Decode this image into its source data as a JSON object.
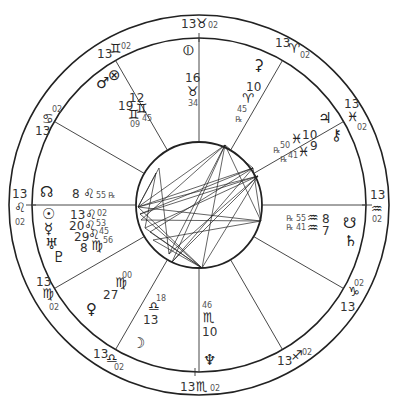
{
  "chart": {
    "center": [
      199,
      205
    ],
    "radii": {
      "outer": 190,
      "middle": 167,
      "inner": 63
    },
    "cusp_angles_deg": [
      0,
      30,
      60,
      90,
      120,
      150,
      180,
      210,
      240,
      270,
      300,
      330
    ]
  },
  "house_cusps": [
    {
      "house": "ASC",
      "deg": "13",
      "sign": "♌",
      "min": "02"
    },
    {
      "house": "2",
      "deg": "13",
      "sign": "♍",
      "min": "02"
    },
    {
      "house": "3",
      "deg": "13",
      "sign": "♎",
      "min": "02"
    },
    {
      "house": "IC",
      "deg": "13",
      "sign": "♏",
      "min": "02"
    },
    {
      "house": "5",
      "deg": "13",
      "sign": "♐",
      "min": "02"
    },
    {
      "house": "6",
      "deg": "13",
      "sign": "♑",
      "min": "02"
    },
    {
      "house": "DSC",
      "deg": "13",
      "sign": "♒",
      "min": "02"
    },
    {
      "house": "8",
      "deg": "13",
      "sign": "♓",
      "min": "02"
    },
    {
      "house": "9",
      "deg": "13",
      "sign": "♈",
      "min": "02"
    },
    {
      "house": "MC",
      "deg": "13",
      "sign": "♉",
      "min": "02"
    },
    {
      "house": "11",
      "deg": "13",
      "sign": "♊",
      "min": "02"
    },
    {
      "house": "12",
      "deg": "13",
      "sign": "♋",
      "min": "02"
    }
  ],
  "planets": [
    {
      "name": "North Node",
      "glyph": "☊",
      "deg": "8",
      "sign": "♌",
      "min": "55",
      "retro": "℞"
    },
    {
      "name": "Sun",
      "glyph": "☉",
      "deg": "13",
      "sign": "♌",
      "min": "02",
      "retro": ""
    },
    {
      "name": "Mercury",
      "glyph": "☿",
      "deg": "20",
      "sign": "♌",
      "min": "53",
      "retro": ""
    },
    {
      "name": "Uranus",
      "glyph": "♅",
      "deg": "29",
      "sign": "♌",
      "min": "45",
      "retro": ""
    },
    {
      "name": "Pluto",
      "glyph": "♇",
      "deg": "8",
      "sign": "♍",
      "min": "56",
      "retro": ""
    },
    {
      "name": "Venus",
      "glyph": "♀",
      "deg": "27",
      "sign": "♍",
      "min": "00",
      "retro": ""
    },
    {
      "name": "Moon",
      "glyph": "☽",
      "deg": "13",
      "sign": "♎",
      "min": "18",
      "retro": ""
    },
    {
      "name": "Neptune",
      "glyph": "♆",
      "deg": "10",
      "sign": "♏",
      "min": "46",
      "retro": ""
    },
    {
      "name": "Saturn",
      "glyph": "♄",
      "deg": "7",
      "sign": "♒",
      "min": "41",
      "retro": "℞"
    },
    {
      "name": "South Node",
      "glyph": "☋",
      "deg": "8",
      "sign": "♒",
      "min": "55",
      "retro": "℞"
    },
    {
      "name": "Chiron",
      "glyph": "⚷",
      "deg": "9",
      "sign": "♓",
      "min": "41",
      "retro": "℞"
    },
    {
      "name": "Jupiter",
      "glyph": "♃",
      "deg": "10",
      "sign": "♓",
      "min": "50",
      "retro": "℞"
    },
    {
      "name": "Ceres",
      "glyph": "⚳",
      "deg": "10",
      "sign": "♈",
      "min": "45",
      "retro": "℞"
    },
    {
      "name": "Part of Fortune",
      "glyph": "⊕",
      "deg": "16",
      "sign": "♉",
      "min": "34",
      "retro": ""
    },
    {
      "name": "Mars",
      "glyph": "♂",
      "deg": "19",
      "sign": "♊",
      "min": "09",
      "retro": ""
    },
    {
      "name": "Vertex",
      "glyph": "⊗",
      "deg": "12",
      "sign": "♊",
      "min": "45",
      "retro": ""
    }
  ],
  "labels": {
    "asc": {
      "deg": "13",
      "sign": "♌",
      "min": "02"
    },
    "mc": {
      "deg": "13",
      "sign": "♉",
      "min": "02"
    },
    "desc": {
      "deg": "13",
      "sign": "♒",
      "min": "02"
    },
    "ic": {
      "deg": "13",
      "sign": "♏",
      "min": "02"
    },
    "c11": {
      "deg": "13",
      "sign": "♊",
      "min": "02"
    },
    "c12": {
      "deg": "13",
      "sign": "♋",
      "min": "02"
    },
    "c9": {
      "deg": "13",
      "sign": "♈",
      "min": "02"
    },
    "c8": {
      "deg": "13",
      "sign": "♓",
      "min": "02"
    },
    "c6": {
      "deg": "13",
      "sign": "♑",
      "min": "02"
    },
    "c5": {
      "deg": "13",
      "sign": "♐",
      "min": "02"
    },
    "c3": {
      "deg": "13",
      "sign": "♎",
      "min": "02"
    },
    "c2": {
      "deg": "13",
      "sign": "♍",
      "min": "02"
    },
    "node_n": {
      "glyph": "☊",
      "deg": "8",
      "sign": "♌",
      "min": "55",
      "retro": "℞"
    },
    "sun": {
      "glyph": "☉",
      "deg": "13",
      "sign": "♌",
      "min": "02"
    },
    "mercury": {
      "glyph": "☿",
      "deg": "20",
      "sign": "♌",
      "min": "53"
    },
    "uranus": {
      "glyph": "♅",
      "deg": "29",
      "sign": "♌",
      "min": "45"
    },
    "pluto": {
      "glyph": "♇",
      "deg": "8",
      "sign": "♍",
      "min": "56"
    },
    "venus": {
      "glyph": "♀",
      "deg": "27",
      "sign": "♍",
      "min": "00"
    },
    "moon": {
      "glyph": "☽",
      "deg": "13",
      "sign": "♎",
      "min": "18"
    },
    "neptune": {
      "glyph": "♆",
      "deg": "10",
      "sign": "♏",
      "min": "46"
    },
    "saturn": {
      "glyph": "♄",
      "deg": "7",
      "sign": "♒",
      "min": "41",
      "retro": "℞"
    },
    "node_s": {
      "glyph": "☋",
      "deg": "8",
      "sign": "♒",
      "min": "55",
      "retro": "℞"
    },
    "chiron": {
      "glyph": "⚷",
      "deg": "9",
      "sign": "♓",
      "min": "41",
      "retro": "℞"
    },
    "jupiter": {
      "glyph": "♃",
      "deg": "10",
      "sign": "♓",
      "min": "50",
      "retro": "℞"
    },
    "ceres": {
      "glyph": "⚳",
      "deg": "10",
      "sign": "♈",
      "min": "45",
      "retro": "℞"
    },
    "fortune": {
      "glyph": "⦶",
      "deg": "16",
      "sign": "♉",
      "min": "34"
    },
    "mars": {
      "glyph": "♂",
      "deg": "19",
      "sign": "♊",
      "min": "09"
    },
    "vertex": {
      "glyph": "⊗",
      "deg": "12",
      "sign": "♊",
      "min": "45"
    }
  },
  "aspect_points": [
    [
      138,
      207
    ],
    [
      140,
      214
    ],
    [
      141,
      220
    ],
    [
      145,
      228
    ],
    [
      150,
      232
    ],
    [
      153,
      240
    ],
    [
      169,
      254
    ],
    [
      172,
      262
    ],
    [
      202,
      268
    ],
    [
      222,
      261
    ],
    [
      159,
      168
    ],
    [
      156,
      173
    ],
    [
      225,
      145
    ],
    [
      253,
      168
    ],
    [
      258,
      176
    ],
    [
      261,
      221
    ],
    [
      255,
      183
    ]
  ]
}
